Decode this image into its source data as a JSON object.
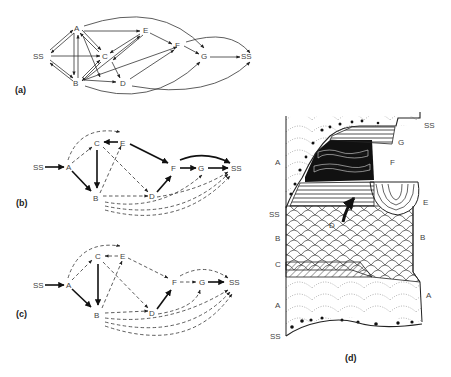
{
  "figure": {
    "panels": [
      {
        "id": "a",
        "label": "(a)",
        "type": "successional-graph",
        "nodes": [
          "SS",
          "A",
          "B",
          "C",
          "D",
          "E",
          "F",
          "G",
          "SS"
        ]
      },
      {
        "id": "b",
        "label": "(b)",
        "type": "successional-graph",
        "nodes": [
          "SS",
          "A",
          "B",
          "C",
          "D",
          "E",
          "F",
          "G",
          "SS"
        ]
      },
      {
        "id": "c",
        "label": "(c)",
        "type": "successional-graph",
        "nodes": [
          "SS",
          "A",
          "B",
          "C",
          "D",
          "E",
          "F",
          "G",
          "SS"
        ]
      },
      {
        "id": "d",
        "label": "(d)",
        "type": "stratigraphic-section",
        "left_labels": [
          "A",
          "SS",
          "B",
          "C",
          "A",
          "SS"
        ],
        "right_labels": [
          "SS",
          "G",
          "F",
          "E",
          "B",
          "A"
        ],
        "center_label": "D"
      }
    ],
    "node_labels": {
      "ss": "SS",
      "a": "A",
      "b": "B",
      "c": "C",
      "d": "D",
      "e": "E",
      "f": "F",
      "g": "G"
    },
    "legend": {
      "solid_heavy": "major transition",
      "dashed": "minor transition"
    }
  }
}
